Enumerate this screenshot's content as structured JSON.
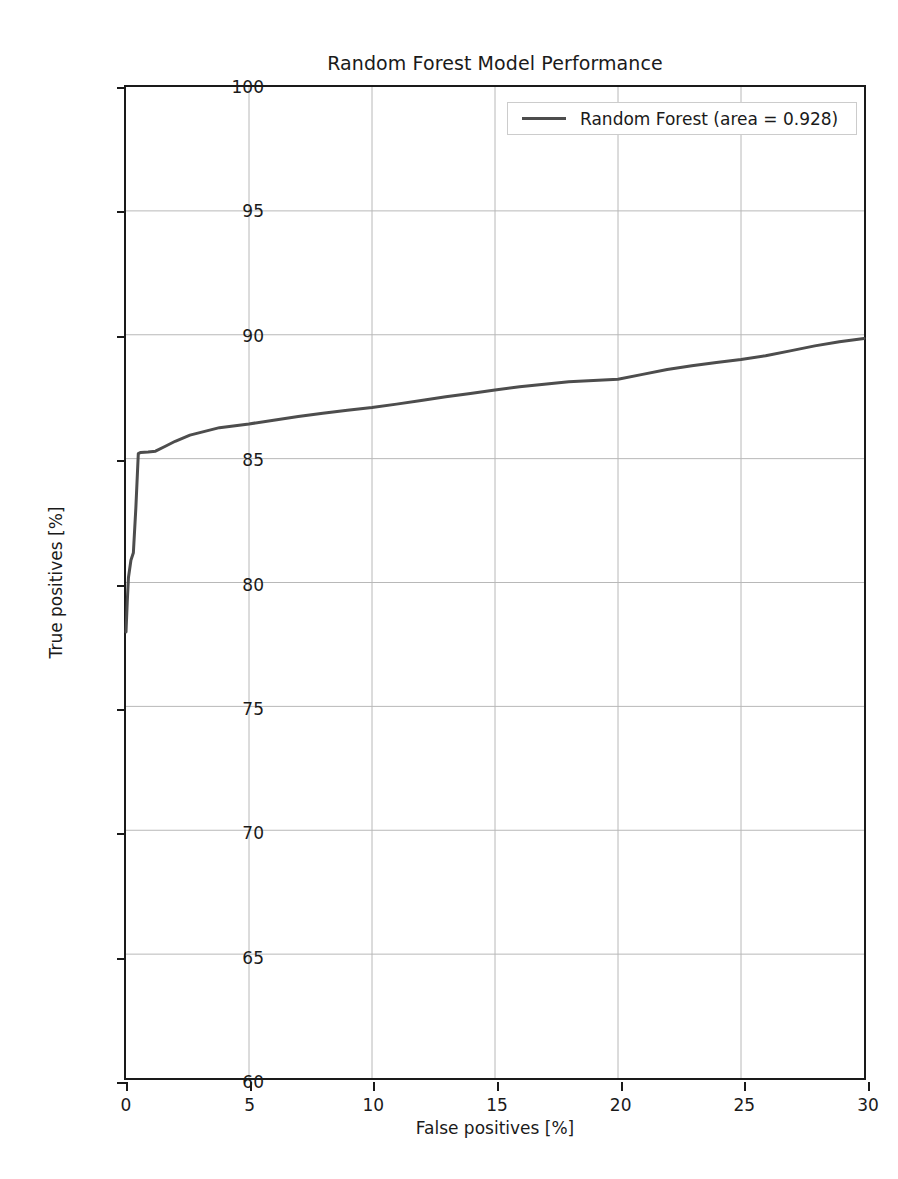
{
  "chart_data": {
    "type": "line",
    "title": "Random Forest Model Performance",
    "xlabel": "False positives [%]",
    "ylabel": "True positives [%]",
    "xlim": [
      0,
      30
    ],
    "ylim": [
      60,
      100
    ],
    "xticks": [
      0,
      5,
      10,
      15,
      20,
      25,
      30
    ],
    "yticks": [
      60,
      65,
      70,
      75,
      80,
      85,
      90,
      95,
      100
    ],
    "grid": true,
    "legend_position": "upper right",
    "legend": [
      "Random Forest (area = 0.928)"
    ],
    "series": [
      {
        "name": "Random Forest (area = 0.928)",
        "area": 0.928,
        "color": "#4d4d4d",
        "x": [
          0.0,
          0.05,
          0.1,
          0.2,
          0.3,
          0.4,
          0.5,
          0.6,
          0.9,
          1.2,
          1.6,
          2.0,
          2.6,
          3.2,
          3.8,
          4.2,
          5.0,
          6.0,
          7.0,
          8.0,
          9.0,
          10.0,
          11.0,
          12.0,
          13.0,
          14.0,
          15.0,
          16.0,
          17.0,
          18.0,
          19.0,
          20.0,
          21.0,
          22.0,
          23.0,
          24.0,
          25.0,
          26.0,
          27.0,
          28.0,
          29.0,
          30.0
        ],
        "y": [
          78.0,
          79.2,
          80.2,
          80.9,
          81.2,
          83.0,
          85.2,
          85.25,
          85.27,
          85.3,
          85.5,
          85.7,
          85.95,
          86.1,
          86.25,
          86.3,
          86.4,
          86.55,
          86.7,
          86.83,
          86.95,
          87.06,
          87.2,
          87.35,
          87.5,
          87.63,
          87.77,
          87.9,
          88.0,
          88.1,
          88.15,
          88.2,
          88.4,
          88.6,
          88.75,
          88.88,
          89.0,
          89.15,
          89.35,
          89.55,
          89.72,
          89.85
        ]
      }
    ]
  },
  "legend": {
    "entry_label": "Random Forest (area = 0.928)"
  }
}
